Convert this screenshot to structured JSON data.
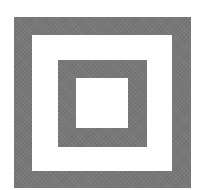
{
  "figure": {
    "colors": {
      "frame": "#777777",
      "background": "#ffffff"
    },
    "layers": [
      {
        "name": "outer-frame",
        "x": 14,
        "y": 17,
        "width": 177,
        "height": 171,
        "fill": "#777777"
      },
      {
        "name": "outer-gap",
        "x": 32,
        "y": 35,
        "width": 140,
        "height": 136,
        "fill": "#ffffff"
      },
      {
        "name": "inner-frame",
        "x": 58,
        "y": 60,
        "width": 89,
        "height": 87,
        "fill": "#777777"
      },
      {
        "name": "inner-center",
        "x": 76,
        "y": 78,
        "width": 52,
        "height": 50,
        "fill": "#ffffff"
      }
    ]
  }
}
